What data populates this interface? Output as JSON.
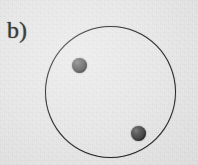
{
  "figure": {
    "panel_label": "b)",
    "background_color": "#e9e9e9",
    "outline_color": "#1e1e1e",
    "particle_color": "#4a4a4a",
    "circle": {
      "name": "droplet-outline",
      "center_x": 111,
      "center_y": 92,
      "radius": 65,
      "stroke_width": 1.7
    },
    "particles": [
      {
        "name": "particle-upper-left",
        "center_x": 80,
        "center_y": 66,
        "radius": 7
      },
      {
        "name": "particle-lower-right",
        "center_x": 139,
        "center_y": 134,
        "radius": 7
      }
    ],
    "particle_count": 2
  },
  "chart_data": {
    "type": "scatter",
    "title": "b)",
    "xlabel": "",
    "ylabel": "",
    "xlim": [
      0,
      198
    ],
    "ylim": [
      0,
      165
    ],
    "grid": false,
    "legend": null,
    "series": [
      {
        "name": "particles",
        "marker": "filled-circle",
        "color": "#4a4a4a",
        "x": [
          80,
          139
        ],
        "y": [
          66,
          134
        ]
      }
    ],
    "annotations": [
      {
        "name": "boundary-circle",
        "shape": "circle",
        "cx": 111,
        "cy": 92,
        "r": 65,
        "fill": "none",
        "stroke": "#1e1e1e"
      },
      {
        "name": "panel-label",
        "text": "b)",
        "x": 7,
        "y": 18
      }
    ]
  }
}
